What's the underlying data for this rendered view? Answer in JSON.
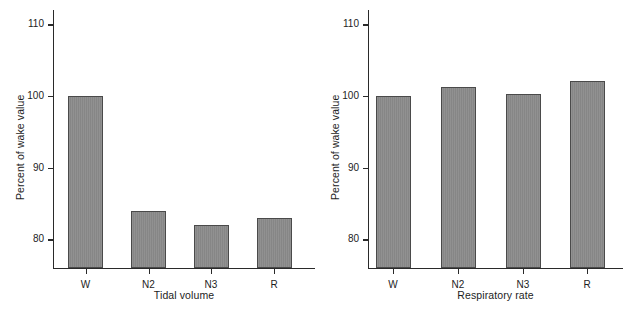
{
  "figure": {
    "background_color": "#ffffff",
    "bar_fill_color": "#8a8a8a",
    "bar_edge_color": "#4a4a4a",
    "axis_color": "#2a2a2a"
  },
  "chart_data": [
    {
      "type": "bar",
      "title": "",
      "xlabel": "Tidal volume",
      "ylabel": "Percent of wake value",
      "categories": [
        "W",
        "N2",
        "N3",
        "R"
      ],
      "values": [
        100,
        84,
        82,
        83
      ],
      "ylim": [
        76,
        112
      ],
      "yticks": [
        80,
        90,
        100,
        110
      ],
      "ytick_labels": [
        "80",
        "90",
        "100",
        "110"
      ],
      "grid": false,
      "legend": "none"
    },
    {
      "type": "bar",
      "title": "",
      "xlabel": "Respiratory rate",
      "ylabel": "Percent of wake value",
      "categories": [
        "W",
        "N2",
        "N3",
        "R"
      ],
      "values": [
        100,
        101.2,
        100.3,
        102.1
      ],
      "ylim": [
        76,
        112
      ],
      "yticks": [
        80,
        90,
        100,
        110
      ],
      "ytick_labels": [
        "80",
        "90",
        "100",
        "110"
      ],
      "grid": false,
      "legend": "none"
    }
  ]
}
